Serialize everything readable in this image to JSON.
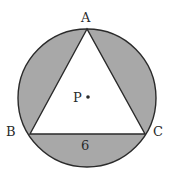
{
  "diagram": {
    "colors": {
      "shade": "#a8a8a8",
      "stroke": "#2a2a2a",
      "triangle_fill": "#ffffff"
    },
    "circle": {
      "cx": 87,
      "cy": 98,
      "r": 70,
      "center_label": "P"
    },
    "vertices": {
      "A": {
        "label": "A",
        "x": 87,
        "y": 28
      },
      "B": {
        "label": "B",
        "x": 30,
        "y": 134
      },
      "C": {
        "label": "C",
        "x": 145,
        "y": 134
      }
    },
    "side_label": "6"
  }
}
